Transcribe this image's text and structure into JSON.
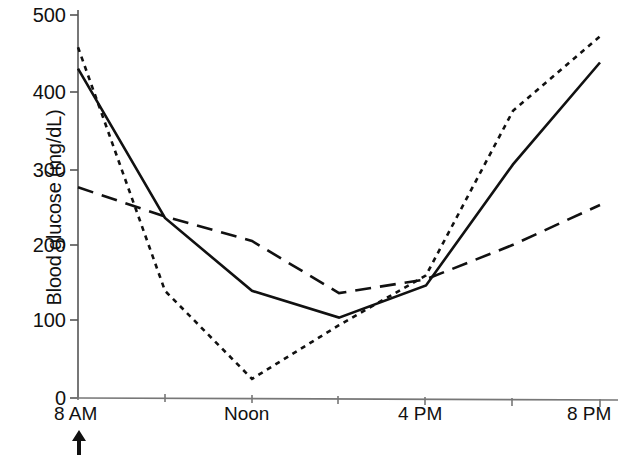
{
  "chart_data": {
    "type": "line",
    "title": "",
    "xlabel": "",
    "ylabel": "Blood glucose (mg/dL)",
    "ylim": [
      0,
      500
    ],
    "yticks": [
      0,
      100,
      200,
      300,
      400,
      500
    ],
    "ytick_labels": [
      "0",
      "100",
      "200",
      "300",
      "400",
      "500"
    ],
    "xlim": [
      "8 AM",
      "8 PM"
    ],
    "x": [
      8,
      10,
      12,
      14,
      16,
      18,
      20
    ],
    "xtick_positions": [
      8,
      10,
      12,
      14,
      16,
      18,
      20
    ],
    "xtick_labels": [
      "8 AM",
      "",
      "Noon",
      "",
      "4 PM",
      "",
      "8 PM"
    ],
    "grid": false,
    "legend": "none",
    "annotations": [
      {
        "name": "dose-arrow",
        "glyph": "up-arrow",
        "at_x": "8 AM",
        "text": ""
      }
    ],
    "series": [
      {
        "name": "solid",
        "style": "solid",
        "color": "#111111",
        "x": [
          8,
          10,
          12,
          14,
          16,
          18,
          20
        ],
        "values": [
          430,
          235,
          140,
          105,
          147,
          305,
          438
        ]
      },
      {
        "name": "short-dotted",
        "style": "dotted",
        "color": "#111111",
        "x": [
          8,
          10,
          12,
          14,
          16,
          18,
          20
        ],
        "values": [
          458,
          140,
          25,
          95,
          160,
          375,
          472
        ]
      },
      {
        "name": "long-dashed",
        "style": "dashed",
        "color": "#111111",
        "x": [
          8,
          10,
          12,
          14,
          16,
          18,
          20
        ],
        "values": [
          275,
          237,
          205,
          137,
          155,
          200,
          252
        ]
      }
    ]
  },
  "axis": {
    "y_label": "Blood glucose (mg/dL)",
    "y_ticks": [
      "500",
      "400",
      "300",
      "200",
      "100",
      "0"
    ],
    "x_ticks": [
      "8 AM",
      "Noon",
      "4 PM",
      "8 PM"
    ]
  }
}
